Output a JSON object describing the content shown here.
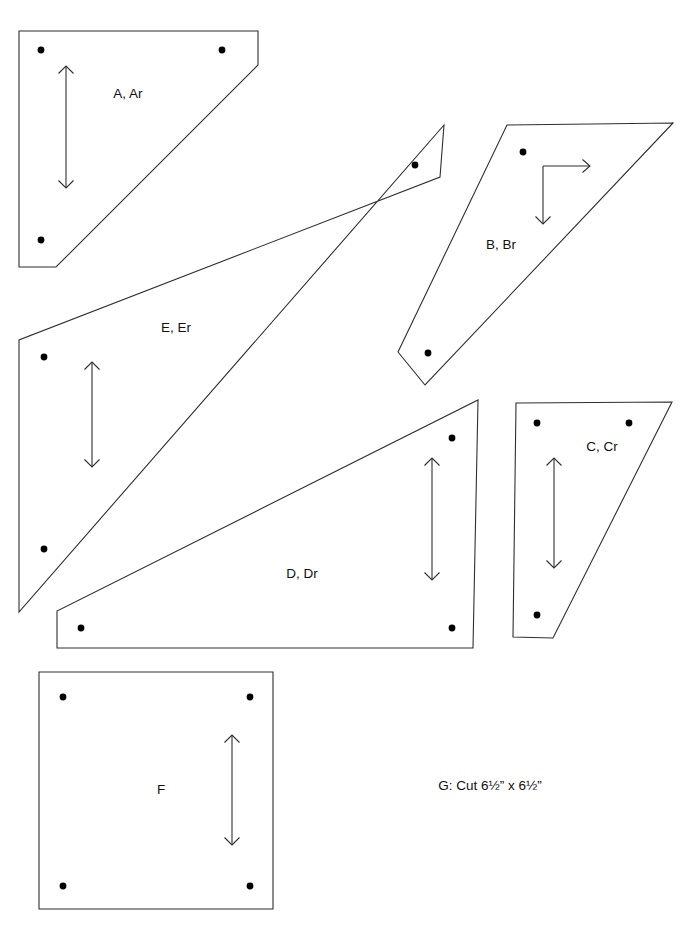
{
  "document": {
    "title": "Pattern Template Sheet",
    "page_width": 694,
    "page_height": 933,
    "background_color": "#ffffff",
    "line_color": "#2f2f2f",
    "dot_color": "#000000",
    "text_color": "#111111"
  },
  "pieces": [
    {
      "id": "A",
      "label": "A, Ar",
      "label_x": 128,
      "label_y": 94,
      "outline": "19,31 258,31 258,65 56,267 19,267",
      "dots": [
        {
          "cx": 41,
          "cy": 50,
          "r": 3.4
        },
        {
          "cx": 222,
          "cy": 50,
          "r": 3.4
        },
        {
          "cx": 41,
          "cy": 240,
          "r": 3.4
        }
      ],
      "arrow": {
        "type": "double-vertical",
        "x": 66,
        "y_top": 66,
        "y_bottom": 188,
        "head": 7.5
      }
    },
    {
      "id": "B",
      "label": "B, Br",
      "label_x": 501,
      "label_y": 245,
      "outline": "507,125 673,123 425,385 398,352",
      "dots": [
        {
          "cx": 523,
          "cy": 152,
          "r": 3.4
        },
        {
          "cx": 428,
          "cy": 353,
          "r": 3.4
        }
      ],
      "arrow": {
        "type": "bent-right-down",
        "corner_x": 543,
        "corner_y": 166,
        "right_x": 590,
        "down_y": 224,
        "head": 7.5
      }
    },
    {
      "id": "C",
      "label": "C, Cr",
      "label_x": 602,
      "label_y": 447,
      "outline": "516,403 672,402 553,638 513,637",
      "dots": [
        {
          "cx": 537,
          "cy": 423,
          "r": 3.4
        },
        {
          "cx": 629,
          "cy": 423,
          "r": 3.4
        },
        {
          "cx": 537,
          "cy": 615,
          "r": 3.4
        }
      ],
      "arrow": {
        "type": "double-vertical",
        "x": 554,
        "y_top": 458,
        "y_bottom": 568,
        "head": 7.5
      }
    },
    {
      "id": "D",
      "label": "D, Dr",
      "label_x": 302,
      "label_y": 574,
      "outline": "478,400 473,648 57,648 57,611",
      "dots": [
        {
          "cx": 452,
          "cy": 438,
          "r": 3.4
        },
        {
          "cx": 452,
          "cy": 628,
          "r": 3.4
        },
        {
          "cx": 81,
          "cy": 628,
          "r": 3.4
        }
      ],
      "arrow": {
        "type": "double-vertical",
        "x": 432,
        "y_top": 458,
        "y_bottom": 580,
        "head": 7.5
      }
    },
    {
      "id": "E",
      "label": "E, Er",
      "label_x": 176,
      "label_y": 328,
      "outline": "444,125 440,177 19,340 19,612",
      "dots": [
        {
          "cx": 415,
          "cy": 165,
          "r": 3.4
        },
        {
          "cx": 44,
          "cy": 357,
          "r": 3.4
        },
        {
          "cx": 44,
          "cy": 549,
          "r": 3.4
        }
      ],
      "arrow": {
        "type": "double-vertical",
        "x": 92,
        "y_top": 362,
        "y_bottom": 467,
        "head": 7.5
      }
    },
    {
      "id": "F",
      "label": "F",
      "label_x": 161,
      "label_y": 790,
      "outline": "39,672 273,672 273,909 39,909",
      "dots": [
        {
          "cx": 63,
          "cy": 697,
          "r": 3.4
        },
        {
          "cx": 250,
          "cy": 697,
          "r": 3.4
        },
        {
          "cx": 63,
          "cy": 886,
          "r": 3.4
        },
        {
          "cx": 250,
          "cy": 886,
          "r": 3.4
        }
      ],
      "arrow": {
        "type": "double-vertical",
        "x": 232,
        "y_top": 735,
        "y_bottom": 845,
        "head": 7.5
      }
    }
  ],
  "notes": [
    {
      "id": "G",
      "text": "G: Cut 6½” x 6½”",
      "x": 490,
      "y": 786
    }
  ]
}
